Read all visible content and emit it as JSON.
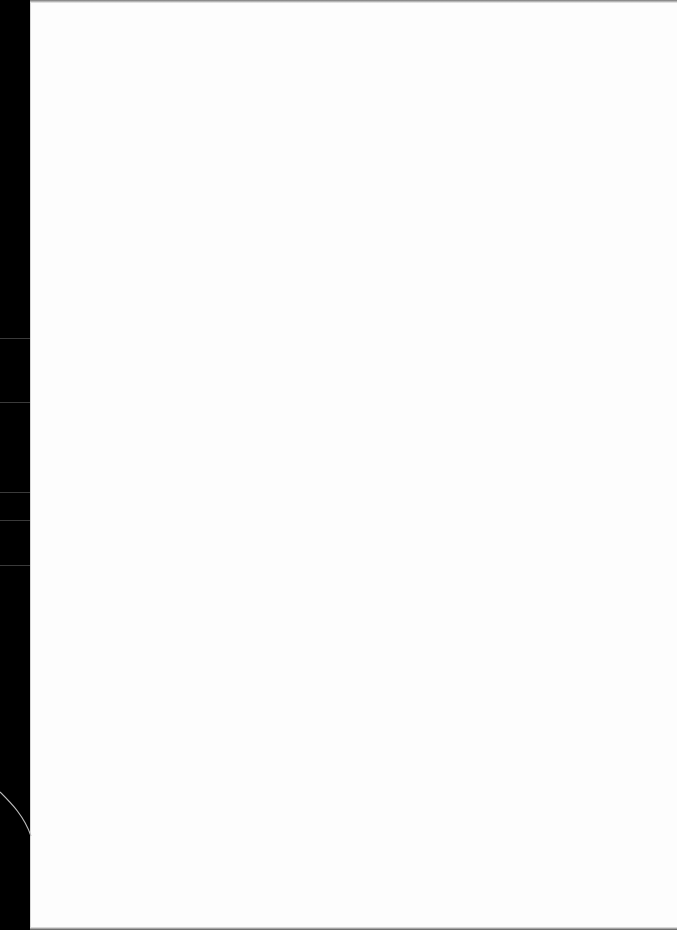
{
  "document": {
    "type": "blank-page-scan",
    "content": "",
    "colors": {
      "paper": "#fdfdfd",
      "background": "#000000"
    }
  }
}
